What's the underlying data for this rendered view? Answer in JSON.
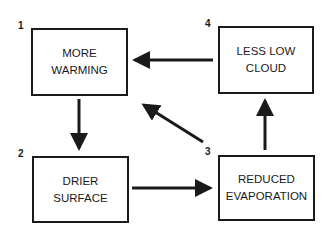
{
  "diagram": {
    "nodes": [
      {
        "id": "1",
        "number": "1",
        "line1": "MORE",
        "line2": "WARMING"
      },
      {
        "id": "2",
        "number": "2",
        "line1": "DRIER",
        "line2": "SURFACE"
      },
      {
        "id": "3",
        "number": "3",
        "line1": "REDUCED",
        "line2": "EVAPORATION"
      },
      {
        "id": "4",
        "number": "4",
        "line1": "LESS LOW",
        "line2": "CLOUD"
      }
    ],
    "edges": [
      {
        "from": "1",
        "to": "2"
      },
      {
        "from": "2",
        "to": "3"
      },
      {
        "from": "3",
        "to": "4"
      },
      {
        "from": "4",
        "to": "1"
      },
      {
        "from": "3",
        "to": "1"
      }
    ],
    "colors": {
      "line": "#1a1a1a",
      "background": "#ffffff"
    }
  }
}
